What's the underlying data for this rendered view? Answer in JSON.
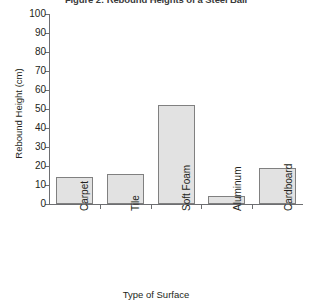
{
  "chart_data": {
    "type": "bar",
    "title": "Figure 2: Rebound Heights of a Steel Ball",
    "xlabel": "Type of Surface",
    "ylabel": "Rebound Height (cm)",
    "categories": [
      "Carpet",
      "Tile",
      "Soft Foam",
      "Aluminum",
      "Cardboard"
    ],
    "values": [
      14,
      16,
      52,
      4,
      19
    ],
    "ylim": [
      0,
      100
    ],
    "ytick_step": 10,
    "ytick_labels": [
      "0",
      "10",
      "20",
      "30",
      "40",
      "50",
      "60",
      "70",
      "80",
      "90",
      "100"
    ],
    "grid": false,
    "legend": false,
    "bar_fill_color": "#e2e2e2",
    "bar_border_color": "#808080",
    "axis_color": "#6d6e71",
    "text_color": "#231f20"
  }
}
